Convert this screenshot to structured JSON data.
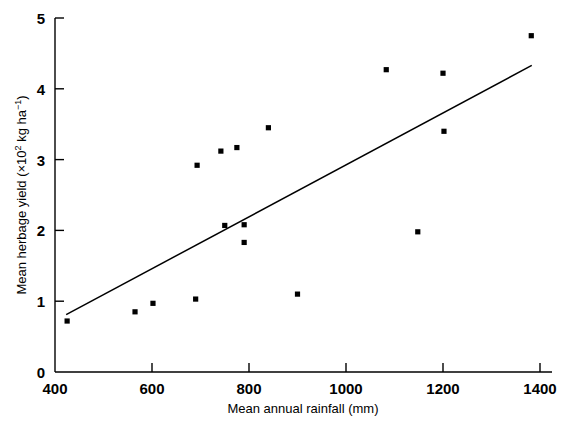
{
  "chart_data": {
    "type": "scatter",
    "title": "",
    "xlabel": "Mean annual rainfall (mm)",
    "ylabel_parts": {
      "lead": "Mean herbage yield (×10",
      "exp": "2",
      "tail": " kg ha",
      "exp2": "−1",
      "close": ")"
    },
    "ylabel": "Mean herbage yield (×10² kg ha⁻¹)",
    "xlim": [
      400,
      1420
    ],
    "ylim": [
      0,
      5
    ],
    "xticks": [
      400,
      600,
      800,
      1000,
      1200,
      1400
    ],
    "xtick_labels": [
      "400",
      "600",
      "800",
      "1000",
      "1200",
      "1400"
    ],
    "yticks": [
      0,
      1,
      2,
      3,
      4,
      5
    ],
    "ytick_labels": [
      "0",
      "1",
      "2",
      "3",
      "4",
      "5"
    ],
    "grid": false,
    "legend": null,
    "marker": "square",
    "marker_color": "#000000",
    "line_color": "#000000",
    "points": [
      {
        "x": 425,
        "y": 0.72
      },
      {
        "x": 565,
        "y": 0.85
      },
      {
        "x": 602,
        "y": 0.97
      },
      {
        "x": 690,
        "y": 1.03
      },
      {
        "x": 693,
        "y": 2.92
      },
      {
        "x": 742,
        "y": 3.12
      },
      {
        "x": 775,
        "y": 3.17
      },
      {
        "x": 750,
        "y": 2.07
      },
      {
        "x": 790,
        "y": 2.08
      },
      {
        "x": 790,
        "y": 1.83
      },
      {
        "x": 840,
        "y": 3.45
      },
      {
        "x": 900,
        "y": 1.1
      },
      {
        "x": 1083,
        "y": 4.27
      },
      {
        "x": 1148,
        "y": 1.98
      },
      {
        "x": 1200,
        "y": 4.22
      },
      {
        "x": 1202,
        "y": 3.4
      },
      {
        "x": 1382,
        "y": 4.75
      }
    ],
    "trend_line": {
      "name": "regression line",
      "x1": 423,
      "y1": 0.81,
      "x2": 1383,
      "y2": 4.33
    }
  }
}
